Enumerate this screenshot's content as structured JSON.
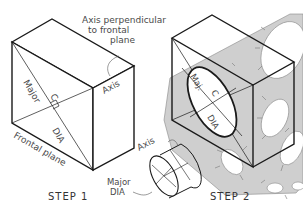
{
  "figure": {
    "step1": {
      "caption": "STEP  1",
      "labels": {
        "axis_perpendicular_line1": "Axis perpendicular",
        "axis_perpendicular_line2": "to frontal",
        "axis_perpendicular_line3": "plane",
        "axis": "Axis",
        "major_dia_diag_1": "Major",
        "major_dia_diag_2": "DIA",
        "center": "C",
        "frontal_plane": "Frontal plane"
      }
    },
    "cylinder_inset": {
      "labels": {
        "axis": "Axis",
        "major_line1": "Major",
        "major_line2": "DIA"
      }
    },
    "step2": {
      "caption": "STEP  2",
      "labels": {
        "major": "Maj.",
        "dia": "DIA",
        "center": "C"
      }
    },
    "colors": {
      "line": "#1a1a1a",
      "thin_line": "#555555",
      "template_fill": "#cfcfcf",
      "background": "#ffffff"
    }
  }
}
